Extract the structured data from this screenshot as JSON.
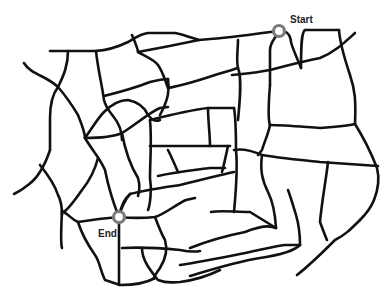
{
  "diagram": {
    "type": "road-network-map",
    "background": "#ffffff",
    "road_color": "#111111",
    "marker_color": "#7a7a7a",
    "markers": [
      {
        "id": "start",
        "label": "Start",
        "x": 279,
        "y": 31
      },
      {
        "id": "end",
        "label": "End",
        "x": 119,
        "y": 217
      }
    ]
  }
}
